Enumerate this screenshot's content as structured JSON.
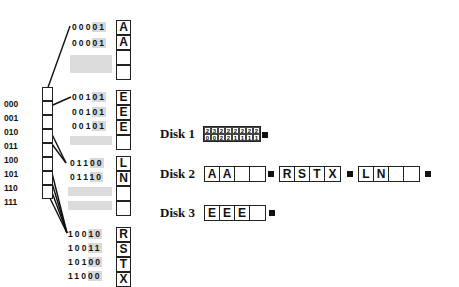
{
  "directory": {
    "entries": [
      "000",
      "001",
      "010",
      "011",
      "100",
      "101",
      "110",
      "111"
    ]
  },
  "buckets": [
    {
      "name": "bucket-1",
      "records": [
        {
          "bits": "00001",
          "letter": "A"
        },
        {
          "bits": "00001",
          "letter": "A"
        },
        {
          "bits": "",
          "letter": ""
        },
        {
          "bits": "",
          "letter": ""
        }
      ]
    },
    {
      "name": "bucket-2",
      "records": [
        {
          "bits": "00101",
          "letter": "E"
        },
        {
          "bits": "00101",
          "letter": "E"
        },
        {
          "bits": "00101",
          "letter": "E"
        },
        {
          "bits": "",
          "letter": ""
        }
      ]
    },
    {
      "name": "bucket-3",
      "records": [
        {
          "bits": "01100",
          "letter": "L"
        },
        {
          "bits": "01110",
          "letter": "N"
        },
        {
          "bits": "",
          "letter": ""
        },
        {
          "bits": "",
          "letter": ""
        }
      ]
    },
    {
      "name": "bucket-4",
      "records": [
        {
          "bits": "10010",
          "letter": "R"
        },
        {
          "bits": "10011",
          "letter": "S"
        },
        {
          "bits": "10100",
          "letter": "T"
        },
        {
          "bits": "11000",
          "letter": "X"
        }
      ]
    }
  ],
  "disks": [
    {
      "label": "Disk 1",
      "directory_top": [
        "2",
        "3",
        "2",
        "2",
        "2",
        "2",
        "2",
        "2"
      ],
      "directory_bottom": [
        "0",
        "0",
        "2",
        "2",
        "1",
        "1",
        "1",
        "1"
      ]
    },
    {
      "label": "Disk 2",
      "blocks": [
        [
          "A",
          "A",
          "",
          ""
        ],
        [
          "R",
          "S",
          "T",
          "X"
        ],
        [
          "L",
          "N",
          "",
          ""
        ]
      ]
    },
    {
      "label": "Disk 3",
      "blocks": [
        [
          "E",
          "E",
          "E",
          ""
        ]
      ]
    }
  ]
}
